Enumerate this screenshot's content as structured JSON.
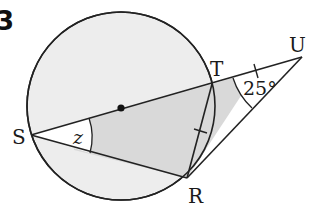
{
  "question_number": "3",
  "points": {
    "S": {
      "label": "S",
      "x": 31,
      "y": 135
    },
    "T": {
      "label": "T",
      "x": 212,
      "y": 84
    },
    "U": {
      "label": "U",
      "x": 302,
      "y": 57
    },
    "R": {
      "label": "R",
      "x": 187,
      "y": 178
    },
    "O": {
      "label": "",
      "x": 121,
      "y": 108
    }
  },
  "circle": {
    "cx": 121,
    "cy": 106,
    "r": 94
  },
  "angles": {
    "at_S": {
      "label": "z"
    },
    "at_U": {
      "label": "25°"
    }
  },
  "colors": {
    "line": "#222222",
    "circle_fill": "#ededed",
    "shade_fill": "#d9d9d9",
    "background": "#ffffff"
  }
}
